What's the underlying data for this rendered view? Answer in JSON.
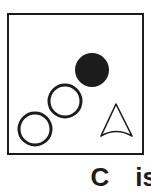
{
  "figure": {
    "caption": {
      "panel_label": "C",
      "text": "is"
    },
    "panel": {
      "border_color": "#1c1c1c",
      "background_color": "#ffffff",
      "border_width_px": 2
    },
    "shapes": [
      {
        "name": "filled-circle",
        "type": "circle",
        "fill": "#1c1c1c",
        "stroke": "none",
        "cx": 83,
        "cy": 55,
        "r": 17
      },
      {
        "name": "open-circle-middle",
        "type": "circle",
        "fill": "#ffffff",
        "stroke": "#1c1c1c",
        "stroke_width": 3,
        "cx": 56,
        "cy": 86,
        "r": 16
      },
      {
        "name": "open-circle-lower-left",
        "type": "circle",
        "fill": "#ffffff",
        "stroke": "#1c1c1c",
        "stroke_width": 3,
        "cx": 26,
        "cy": 114,
        "r": 16
      },
      {
        "name": "north-arrow",
        "type": "arrow",
        "fill": "#ffffff",
        "stroke": "#1c1c1c",
        "stroke_width": 1.6,
        "apex_x": 107,
        "apex_y": 89,
        "left_x": 92,
        "left_y": 121,
        "right_x": 123,
        "right_y": 121,
        "notch_x": 107,
        "notch_y": 112
      }
    ]
  }
}
